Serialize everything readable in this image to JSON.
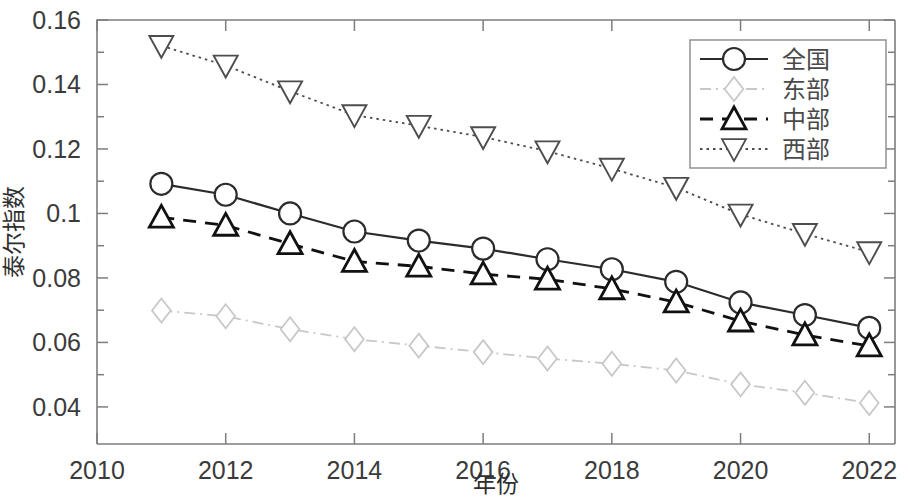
{
  "chart_data": {
    "type": "line",
    "title": "",
    "xlabel": "年份",
    "ylabel": "泰尔指数",
    "x": [
      2011,
      2012,
      2013,
      2014,
      2015,
      2016,
      2017,
      2018,
      2019,
      2020,
      2021,
      2022
    ],
    "xlim": [
      2010,
      2022.4
    ],
    "ylim": [
      0.0285,
      0.16
    ],
    "xticks": [
      2010,
      2012,
      2014,
      2016,
      2018,
      2020,
      2022
    ],
    "xtick_labels": [
      "2010",
      "2012",
      "2014",
      "2016",
      "2018",
      "2020",
      "2022"
    ],
    "yticks": [
      0.04,
      0.06,
      0.08,
      0.1,
      0.12,
      0.14,
      0.16
    ],
    "ytick_labels": [
      "0.04",
      "0.06",
      "0.08",
      "0.1",
      "0.12",
      "0.14",
      "0.16"
    ],
    "y_minor_ticks": [
      0.05,
      0.07,
      0.09,
      0.11,
      0.13,
      0.15
    ],
    "grid": false,
    "legend_position": "top-right",
    "series": [
      {
        "name": "全国",
        "marker": "circle",
        "line_style": "solid",
        "color": "#2b2b2b",
        "values": [
          0.1092,
          0.1058,
          0.1,
          0.0944,
          0.0916,
          0.0891,
          0.0858,
          0.0827,
          0.0788,
          0.0724,
          0.0685,
          0.0645
        ]
      },
      {
        "name": "东部",
        "marker": "diamond",
        "line_style": "dashdot",
        "color": "#c8c8c8",
        "values": [
          0.0699,
          0.0681,
          0.0641,
          0.061,
          0.059,
          0.057,
          0.055,
          0.0534,
          0.0513,
          0.047,
          0.0444,
          0.0412
        ]
      },
      {
        "name": "中部",
        "marker": "triangle-up",
        "line_style": "dashed",
        "color": "#111111",
        "values": [
          0.0988,
          0.0963,
          0.0906,
          0.0851,
          0.0836,
          0.0812,
          0.0796,
          0.0766,
          0.0725,
          0.0666,
          0.0623,
          0.0589
        ]
      },
      {
        "name": "西部",
        "marker": "triangle-down",
        "line_style": "dotted",
        "color": "#4d4d4d",
        "values": [
          0.152,
          0.1459,
          0.1379,
          0.1305,
          0.1272,
          0.1237,
          0.1193,
          0.1139,
          0.108,
          0.0997,
          0.0937,
          0.088
        ]
      }
    ]
  }
}
